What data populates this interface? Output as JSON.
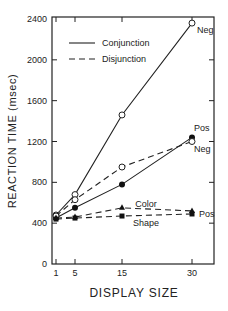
{
  "chart_data": {
    "type": "line",
    "title": "",
    "xlabel": "DISPLAY SIZE",
    "ylabel": "REACTION TIME (msec)",
    "x": [
      1,
      5,
      15,
      30
    ],
    "x_ticks": [
      "1",
      "5",
      "15",
      "30"
    ],
    "y_ticks": [
      "0",
      "400",
      "800",
      "1200",
      "1600",
      "2000",
      "2400"
    ],
    "ylim": [
      0,
      2400
    ],
    "grid": false,
    "legend": {
      "position": "upper-left",
      "entries": [
        {
          "label": "Conjunction",
          "style": "solid"
        },
        {
          "label": "Disjunction",
          "style": "dashed"
        }
      ]
    },
    "series": [
      {
        "name": "Conjunction Neg",
        "style": "solid",
        "marker": "open-circle",
        "values": [
          480,
          680,
          1460,
          2360
        ],
        "end_label": "Neg"
      },
      {
        "name": "Conjunction Pos",
        "style": "solid",
        "marker": "filled-circle",
        "values": [
          450,
          550,
          780,
          1240
        ],
        "end_label": "Pos"
      },
      {
        "name": "Disjunction Neg",
        "style": "dashed",
        "marker": "open-circle",
        "values": [
          470,
          630,
          950,
          1200
        ],
        "end_label": "Neg"
      },
      {
        "name": "Color Pos",
        "style": "dashed",
        "marker": "filled-triangle",
        "values": [
          450,
          460,
          550,
          520
        ],
        "end_label": "Pos"
      },
      {
        "name": "Shape Pos",
        "style": "dashed",
        "marker": "filled-square",
        "values": [
          440,
          450,
          470,
          490
        ],
        "end_label": ""
      }
    ],
    "annotations": [
      {
        "text": "Color",
        "near_series": "Color Pos"
      },
      {
        "text": "Shape",
        "near_series": "Shape Pos"
      }
    ]
  }
}
